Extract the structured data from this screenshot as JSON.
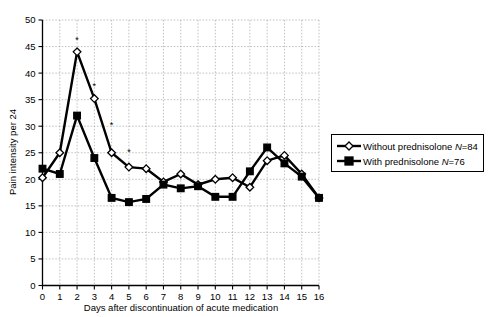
{
  "chart_data": {
    "type": "line",
    "title": "",
    "xlabel": "Days after discontinuation of acute medication",
    "ylabel": "Pain intensity per 24",
    "xlim": [
      0,
      16
    ],
    "ylim": [
      0,
      50
    ],
    "xticks": [
      0,
      1,
      2,
      3,
      4,
      5,
      6,
      7,
      8,
      9,
      10,
      11,
      12,
      13,
      14,
      15,
      16
    ],
    "yticks": [
      0,
      5,
      10,
      15,
      20,
      25,
      30,
      35,
      40,
      45,
      50
    ],
    "grid": true,
    "legend_position": "right",
    "x": [
      0,
      1,
      2,
      3,
      4,
      5,
      6,
      7,
      8,
      9,
      10,
      11,
      12,
      13,
      14,
      15,
      16
    ],
    "series": [
      {
        "name": "Without prednisolone N=84",
        "label_main": "Without prednisolone ",
        "label_italic": "N",
        "label_tail": "=84",
        "marker": "open-diamond",
        "values": [
          20.3,
          25.0,
          44.0,
          35.2,
          25.0,
          22.3,
          22.0,
          19.5,
          21.0,
          19.0,
          20.0,
          20.3,
          18.5,
          23.5,
          24.5,
          21.0,
          16.5
        ]
      },
      {
        "name": "With prednisolone N=76",
        "label_main": "With prednisolone ",
        "label_italic": "N",
        "label_tail": "=76",
        "marker": "filled-square",
        "values": [
          22.0,
          21.0,
          32.0,
          24.0,
          16.5,
          15.7,
          16.3,
          19.0,
          18.3,
          18.7,
          16.7,
          16.7,
          21.5,
          26.0,
          23.0,
          20.5,
          16.5
        ]
      }
    ],
    "annotations": [
      {
        "symbol": "*",
        "x": 2,
        "y": 46.2
      },
      {
        "symbol": "*",
        "x": 3,
        "y": 37.6
      },
      {
        "symbol": "*",
        "x": 4,
        "y": 30.2
      },
      {
        "symbol": "*",
        "x": 5,
        "y": 25.1
      }
    ]
  },
  "colors": {
    "line": "#000000",
    "grid": "#9a9a9a",
    "background": "#ffffff"
  }
}
